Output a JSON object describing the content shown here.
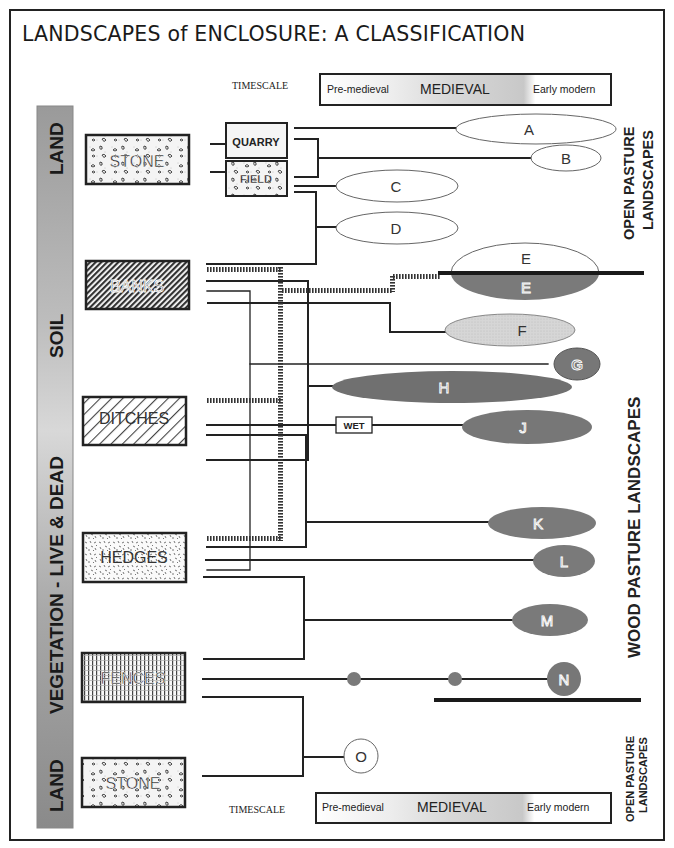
{
  "title": "LANDSCAPES of ENCLOSURE: A CLASSIFICATION",
  "timescale": {
    "label": "TIMESCALE",
    "periods": [
      "Pre-medieval",
      "MEDIEVAL",
      "Early modern"
    ]
  },
  "sidebar": {
    "segments": [
      "LAND",
      "SOIL",
      "VEGETATION - LIVE & DEAD",
      "LAND"
    ],
    "color": "#9a9a9a"
  },
  "boundary_types": [
    {
      "id": "stone-top",
      "label": "STONE",
      "pattern": "stones"
    },
    {
      "id": "banks",
      "label": "BANKS",
      "pattern": "dense-diagonal-hatch"
    },
    {
      "id": "ditches",
      "label": "DITCHES",
      "pattern": "diagonal-hatch"
    },
    {
      "id": "hedges",
      "label": "HEDGES",
      "pattern": "speckle"
    },
    {
      "id": "fences",
      "label": "FENCES",
      "pattern": "grid"
    },
    {
      "id": "stone-bottom",
      "label": "STONE",
      "pattern": "stones"
    }
  ],
  "sub_types": {
    "quarry": "QUARRY",
    "field": "FIELD",
    "wet": "WET"
  },
  "landscapes": {
    "A": {
      "label": "A",
      "fill": "#ffffff"
    },
    "B": {
      "label": "B",
      "fill": "#ffffff"
    },
    "C": {
      "label": "C",
      "fill": "#ffffff"
    },
    "D": {
      "label": "D",
      "fill": "#ffffff"
    },
    "E_open": {
      "label": "E",
      "fill": "#ffffff"
    },
    "E_wood": {
      "label": "E",
      "fill": "#7a7a7a"
    },
    "F": {
      "label": "F",
      "fill": "#d4d4d4"
    },
    "G": {
      "label": "G",
      "fill": "#777777"
    },
    "H": {
      "label": "H",
      "fill": "#707070"
    },
    "J": {
      "label": "J",
      "fill": "#777777"
    },
    "K": {
      "label": "K",
      "fill": "#7a7a7a"
    },
    "L": {
      "label": "L",
      "fill": "#7a7a7a"
    },
    "M": {
      "label": "M",
      "fill": "#7a7a7a"
    },
    "N": {
      "label": "N",
      "fill": "#777777"
    },
    "O": {
      "label": "O",
      "fill": "#ffffff"
    }
  },
  "zones": {
    "open_top": [
      "OPEN PASTURE",
      "LANDSCAPES"
    ],
    "wood": "WOOD PASTURE LANDSCAPES",
    "open_bottom": [
      "OPEN PASTURE",
      "LANDSCAPES"
    ]
  }
}
